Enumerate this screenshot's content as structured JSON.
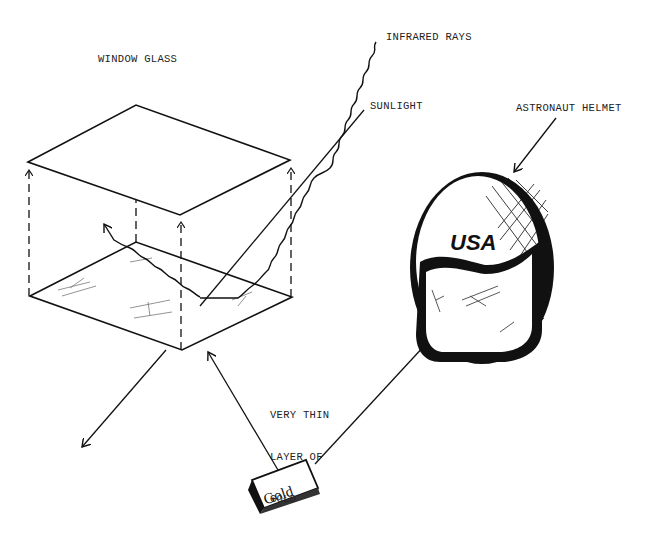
{
  "labels": {
    "window_glass": "WINDOW GLASS",
    "infrared_rays": "INFRARED RAYS",
    "sunlight": "SUNLIGHT",
    "astronaut_helmet": "ASTRONAUT HELMET",
    "gold_layer_line1": "VERY THIN",
    "gold_layer_line2": "LAYER OF",
    "gold_layer_line3": "GOLD",
    "helmet_text": "USA",
    "gold_bar_text": "Gold"
  },
  "colors": {
    "ink": "#111111",
    "background": "#ffffff"
  }
}
